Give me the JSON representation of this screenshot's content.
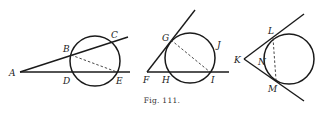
{
  "caption": "Fig. 111.",
  "figures": [
    {
      "id": "fig-a",
      "points": {
        "A": "A",
        "B": "B",
        "C": "C",
        "D": "D",
        "E": "E"
      },
      "description": "Two secants from external point A through circle; dashed chord BE"
    },
    {
      "id": "fig-b",
      "points": {
        "F": "F",
        "G": "G",
        "H": "H",
        "I": "I",
        "J": "J"
      },
      "description": "Tangent FG and secant FHI from external point F; dashed chord GI"
    },
    {
      "id": "fig-c",
      "points": {
        "K": "K",
        "L": "L",
        "M": "M",
        "N": "N"
      },
      "description": "Two tangents KL and KM from external point K; dashed chord LM"
    }
  ]
}
